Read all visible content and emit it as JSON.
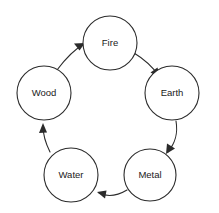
{
  "diagram": {
    "type": "cycle-diagram",
    "background_color": "#ffffff",
    "stroke_color": "#2b2b2b",
    "label_color": "#1a1a1a",
    "direction": "clockwise",
    "nodes": [
      {
        "id": "fire",
        "label": "Fire",
        "cx": 110,
        "cy": 43,
        "r": 27
      },
      {
        "id": "earth",
        "label": "Earth",
        "cx": 172,
        "cy": 93,
        "r": 27
      },
      {
        "id": "metal",
        "label": "Metal",
        "cx": 150,
        "cy": 175,
        "r": 26
      },
      {
        "id": "water",
        "label": "Water",
        "cx": 71,
        "cy": 175,
        "r": 27
      },
      {
        "id": "wood",
        "label": "Wood",
        "cx": 44,
        "cy": 93,
        "r": 27
      }
    ],
    "edges": [
      {
        "id": "wood-to-fire",
        "from": "Wood",
        "to": "Fire",
        "arrow": "arrow-head-icon"
      },
      {
        "id": "fire-to-earth",
        "from": "Fire",
        "to": "Earth",
        "arrow": "arrow-head-icon"
      },
      {
        "id": "earth-to-metal",
        "from": "Earth",
        "to": "Metal",
        "arrow": "arrow-head-icon"
      },
      {
        "id": "metal-to-water",
        "from": "Metal",
        "to": "Water",
        "arrow": "arrow-head-icon"
      },
      {
        "id": "water-to-wood",
        "from": "Water",
        "to": "Wood",
        "arrow": "arrow-head-icon"
      }
    ]
  }
}
